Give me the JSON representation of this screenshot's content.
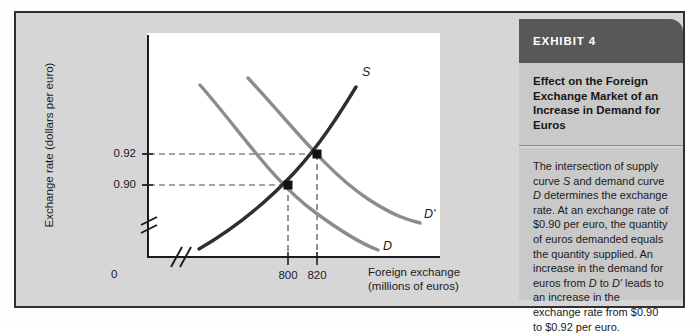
{
  "exhibit": {
    "header": "EXHIBIT 4",
    "title": "Effect on the Foreign Exchange Market of an Increase in Demand for Euros",
    "body_full": "The intersection of supply curve S and demand curve D determines the exchange rate. At an exchange rate of $0.90 per euro, the quantity of euros demanded equals the quantity supplied. An increase in the demand for euros from D to D' leads to an increase in the exchange rate from $0.90 to $0.92 per euro.",
    "body_segments": [
      {
        "text": "The intersection of supply curve ",
        "italic": false
      },
      {
        "text": "S",
        "italic": true
      },
      {
        "text": " and demand curve ",
        "italic": false
      },
      {
        "text": "D",
        "italic": true
      },
      {
        "text": " determines the exchange rate. At an exchange rate of $0.90 per euro, the quantity of euros demanded equals the quantity supplied. An increase in the demand for euros from ",
        "italic": false
      },
      {
        "text": "D",
        "italic": true
      },
      {
        "text": " to ",
        "italic": false
      },
      {
        "text": "D'",
        "italic": true
      },
      {
        "text": " leads to an increase in the exchange rate from $0.90 to $0.92 per euro.",
        "italic": false
      }
    ],
    "header_bg": "#585858",
    "panel_bg": "#c9c9c9"
  },
  "chart_data": {
    "type": "line",
    "title": "",
    "xlabel_line1": "Foreign exchange",
    "xlabel_line2": "(millions of euros)",
    "ylabel": "Exchange rate (dollars per euro)",
    "origin_label": "0",
    "x_ticks": [
      {
        "label": "800",
        "value": 800
      },
      {
        "label": "820",
        "value": 820
      }
    ],
    "y_ticks": [
      {
        "label": "0.92",
        "value": 0.92
      },
      {
        "label": "0.90",
        "value": 0.9
      }
    ],
    "axis_break_x": true,
    "axis_break_y": true,
    "grid": false,
    "legend": "inline-curve-labels",
    "series": [
      {
        "name": "S",
        "label": "S",
        "role": "supply",
        "color": "#2f2f2f",
        "slope": "upward"
      },
      {
        "name": "D",
        "label": "D",
        "role": "demand-original",
        "color": "#8c8c8c",
        "slope": "downward"
      },
      {
        "name": "D'",
        "label": "D'",
        "role": "demand-increased",
        "color": "#8c8c8c",
        "slope": "downward"
      }
    ],
    "equilibria": [
      {
        "name": "initial",
        "x": 800,
        "y": 0.9,
        "curves": [
          "S",
          "D"
        ]
      },
      {
        "name": "new",
        "x": 820,
        "y": 0.92,
        "curves": [
          "S",
          "D'"
        ]
      }
    ]
  }
}
